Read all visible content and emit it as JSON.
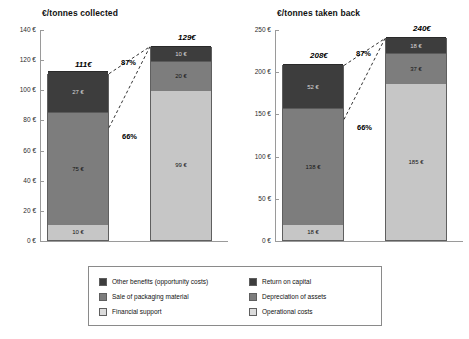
{
  "chart_data": [
    {
      "type": "bar",
      "title": "€/tonnes collected",
      "xlabel": "",
      "ylabel": "",
      "ylim": [
        0,
        140
      ],
      "ytick_labels": [
        "140 €",
        "120 €",
        "100 €",
        "80 €",
        "60 €",
        "40 €",
        "20 €",
        "0 €"
      ],
      "ytick_values": [
        140,
        120,
        100,
        80,
        60,
        40,
        20,
        0
      ],
      "grid": false,
      "stacked": true,
      "categories": [
        "benefits",
        "costs"
      ],
      "bars": [
        {
          "total_label": "111€",
          "total_value": 111,
          "segments": [
            {
              "name": "Financial support",
              "value": 10,
              "label": "10 €",
              "tone": "light"
            },
            {
              "name": "Sale of packaging material",
              "value": 75,
              "label": "75 €",
              "tone": "mid"
            },
            {
              "name": "Other benefits (opportunity costs)",
              "value": 27,
              "label": "27 €",
              "tone": "dark"
            }
          ]
        },
        {
          "total_label": "129€",
          "total_value": 129,
          "segments": [
            {
              "name": "Operational costs",
              "value": 99,
              "label": "99 €",
              "tone": "light"
            },
            {
              "name": "Depreciation of assets",
              "value": 20,
              "label": "20 €",
              "tone": "mid"
            },
            {
              "name": "Return on capital",
              "value": 10,
              "label": "10 €",
              "tone": "dark"
            }
          ]
        }
      ],
      "annotations": [
        {
          "text": "87%",
          "anchor": "top-connector"
        },
        {
          "text": "66%",
          "anchor": "bottom-connector"
        }
      ]
    },
    {
      "type": "bar",
      "title": "€/tonnes taken back",
      "xlabel": "",
      "ylabel": "",
      "ylim": [
        0,
        250
      ],
      "ytick_labels": [
        "250 €",
        "200 €",
        "150 €",
        "100 €",
        "50 €",
        "0 €"
      ],
      "ytick_values": [
        250,
        200,
        150,
        100,
        50,
        0
      ],
      "grid": false,
      "stacked": true,
      "categories": [
        "benefits",
        "costs"
      ],
      "bars": [
        {
          "total_label": "208€",
          "total_value": 208,
          "segments": [
            {
              "name": "Financial support",
              "value": 18,
              "label": "18 €",
              "tone": "light"
            },
            {
              "name": "Sale of packaging material",
              "value": 138,
              "label": "138 €",
              "tone": "mid"
            },
            {
              "name": "Other benefits (opportunity costs)",
              "value": 52,
              "label": "52 €",
              "tone": "dark"
            }
          ]
        },
        {
          "total_label": "240€",
          "total_value": 240,
          "segments": [
            {
              "name": "Operational costs",
              "value": 185,
              "label": "185 €",
              "tone": "light"
            },
            {
              "name": "Depreciation of assets",
              "value": 37,
              "label": "37 €",
              "tone": "mid"
            },
            {
              "name": "Return on capital",
              "value": 18,
              "label": "18 €",
              "tone": "dark"
            }
          ]
        }
      ],
      "annotations": [
        {
          "text": "87%",
          "anchor": "top-connector"
        },
        {
          "text": "66%",
          "anchor": "bottom-connector"
        }
      ]
    }
  ],
  "legend": {
    "left_column": [
      {
        "label": "Other benefits (opportunity costs)",
        "tone": "dark"
      },
      {
        "label": "Sale of packaging material",
        "tone": "mid"
      },
      {
        "label": "Financial support",
        "tone": "light"
      }
    ],
    "right_column": [
      {
        "label": "Return on capital",
        "tone": "dark"
      },
      {
        "label": "Depreciation of assets",
        "tone": "mid"
      },
      {
        "label": "Operational costs",
        "tone": "light"
      }
    ]
  },
  "colors": {
    "dark": "#3d3d3d",
    "mid": "#7d7d7d",
    "light": "#c6c6c6",
    "legend_light": "#dcdcdc",
    "axis": "#9a9a9a",
    "text": "#111111"
  }
}
